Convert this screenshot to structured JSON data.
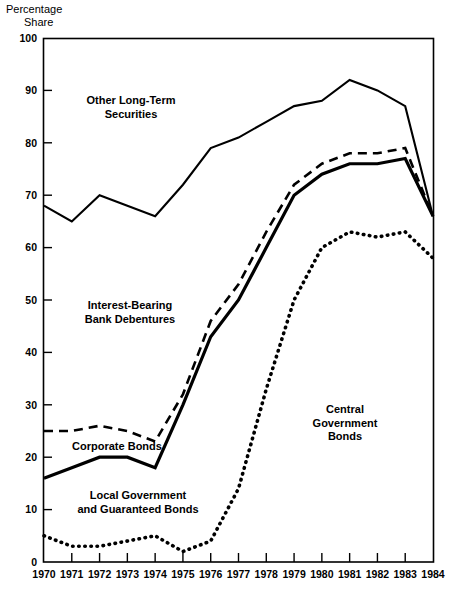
{
  "chart_data": {
    "type": "line",
    "title": "",
    "ylabel_lines": [
      "Percentage",
      "Share"
    ],
    "xlabel": "",
    "ylim": [
      0,
      100
    ],
    "yticks": [
      0,
      10,
      20,
      30,
      40,
      50,
      60,
      70,
      80,
      90,
      100
    ],
    "ytick_labels": [
      "0",
      "10",
      "20",
      "30",
      "40",
      "50",
      "60",
      "70",
      "80",
      "90",
      "100"
    ],
    "grid": false,
    "legend_position": "inline-annotations",
    "x": [
      1970,
      1971,
      1972,
      1973,
      1974,
      1975,
      1976,
      1977,
      1978,
      1979,
      1980,
      1981,
      1982,
      1983,
      1984
    ],
    "categories": [
      "1970",
      "1971",
      "1972",
      "1973",
      "1974",
      "1975",
      "1976",
      "1977",
      "1978",
      "1979",
      "1980",
      "1981",
      "1982",
      "1983",
      "1984"
    ],
    "series": [
      {
        "name": "Other Long-Term Securities",
        "style": "solid-thin",
        "values": [
          68,
          65,
          70,
          68,
          66,
          72,
          79,
          81,
          84,
          87,
          88,
          92,
          90,
          87,
          66
        ]
      },
      {
        "name": "Interest-Bearing Bank Debentures",
        "style": "dashed",
        "values": [
          25,
          25,
          26,
          25,
          23,
          32,
          46,
          53,
          63,
          72,
          76,
          78,
          78,
          79,
          66
        ]
      },
      {
        "name": "Corporate Bonds",
        "style": "solid-thick",
        "values": [
          16,
          18,
          20,
          20,
          18,
          30,
          43,
          50,
          60,
          70,
          74,
          76,
          76,
          77,
          66
        ]
      },
      {
        "name": "Central Government Bonds",
        "style": "dotted",
        "values": [
          5,
          3,
          3,
          4,
          5,
          2,
          4,
          14,
          33,
          50,
          60,
          63,
          62,
          63,
          58
        ]
      }
    ],
    "annotations": [
      {
        "id": "other-long-term-securities",
        "lines": [
          "Other Long-Term",
          "Securities"
        ],
        "x_px": 131,
        "y_px": 104
      },
      {
        "id": "interest-bearing-bank-debentures",
        "lines": [
          "Interest-Bearing",
          "Bank Debentures"
        ],
        "x_px": 130,
        "y_px": 309
      },
      {
        "id": "corporate-bonds",
        "lines": [
          "Corporate Bonds"
        ],
        "x_px": 117,
        "y_px": 450
      },
      {
        "id": "local-government-and-guaranteed-bonds",
        "lines": [
          "Local Government",
          "and Guaranteed Bonds"
        ],
        "x_px": 138,
        "y_px": 499
      },
      {
        "id": "central-government-bonds",
        "lines": [
          "Central",
          "Government",
          "Bonds"
        ],
        "x_px": 345,
        "y_px": 413
      }
    ],
    "colors": {
      "line": "#000000",
      "axis": "#000000",
      "background": "#ffffff"
    }
  }
}
